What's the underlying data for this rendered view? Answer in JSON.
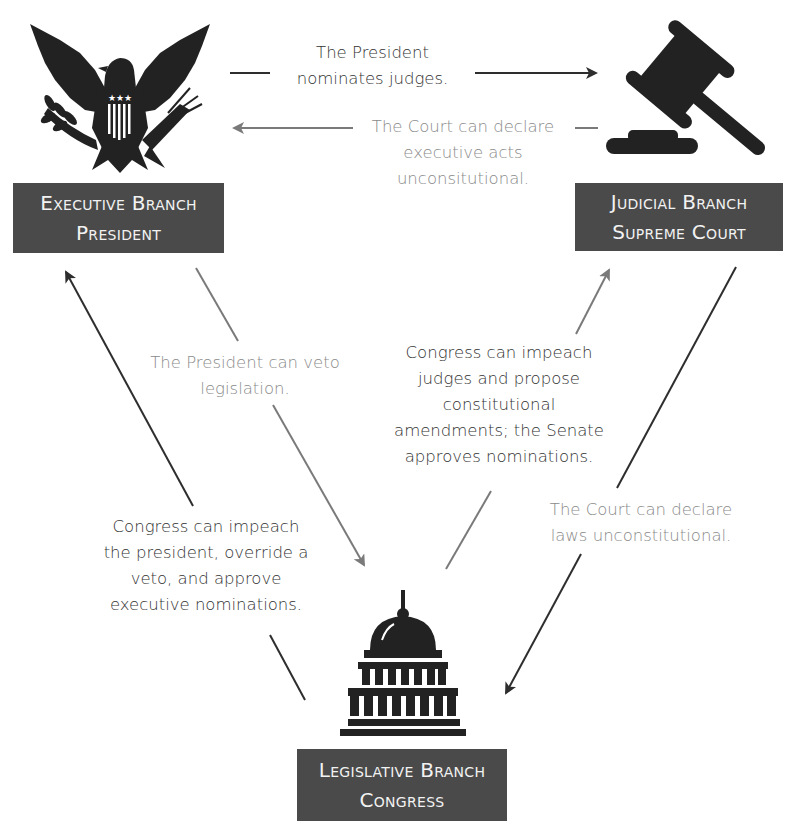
{
  "diagram": {
    "colors": {
      "box_background": "#4a4a4a",
      "box_text": "#f2f2f2",
      "dark_text": "#333333",
      "gray_text": "#8a8a8a",
      "dark_arrow": "#2e2e2e",
      "gray_arrow": "#7a7a7a"
    },
    "branches": {
      "executive": {
        "icon": "eagle-seal-icon",
        "line1": "Executive Branch",
        "line2": "President"
      },
      "judicial": {
        "icon": "gavel-icon",
        "line1": "Judicial Branch",
        "line2": "Supreme Court"
      },
      "legislative": {
        "icon": "capitol-building-icon",
        "line1": "Legislative Branch",
        "line2": "Congress"
      }
    },
    "relations": {
      "exec_to_judicial": {
        "from": "Executive Branch",
        "to": "Judicial Branch",
        "style": "dark",
        "lines": [
          "The President",
          "nominates judges."
        ]
      },
      "judicial_to_exec": {
        "from": "Judicial Branch",
        "to": "Executive Branch",
        "style": "gray",
        "lines": [
          "The Court can declare",
          "executive acts",
          "unconsitutional."
        ]
      },
      "exec_to_legislative": {
        "from": "Executive Branch",
        "to": "Legislative Branch",
        "style": "gray",
        "lines": [
          "The President can veto",
          "legislation."
        ]
      },
      "legislative_to_exec": {
        "from": "Legislative Branch",
        "to": "Executive Branch",
        "style": "dark",
        "lines": [
          "Congress can impeach",
          "the president, override a",
          "veto, and approve",
          "executive nominations."
        ]
      },
      "legislative_to_judicial": {
        "from": "Legislative Branch",
        "to": "Judicial Branch",
        "style": "gray",
        "lines": [
          "Congress can impeach",
          "judges and propose",
          "constitutional",
          "amendments; the Senate",
          "approves nominations."
        ]
      },
      "judicial_to_legislative": {
        "from": "Judicial Branch",
        "to": "Legislative Branch",
        "style": "gray",
        "lines": [
          "The Court can declare",
          "laws unconstitutional."
        ]
      }
    }
  }
}
